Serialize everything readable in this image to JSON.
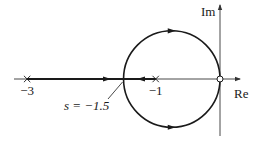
{
  "diagram": {
    "type": "root-locus",
    "axes": {
      "real_label": "Re",
      "imag_label": "Im"
    },
    "poles": [
      {
        "value": -3,
        "label": "−3"
      },
      {
        "value": -1,
        "label": "−1"
      }
    ],
    "zero": {
      "value": 0
    },
    "breakaway": {
      "value": -1.5,
      "label": "s = −1.5"
    },
    "locus_circle": {
      "center": -0.75,
      "radius": 0.75
    },
    "colors": {
      "line": "#1a1a1a",
      "axis": "#333333",
      "background": "#ffffff"
    }
  }
}
